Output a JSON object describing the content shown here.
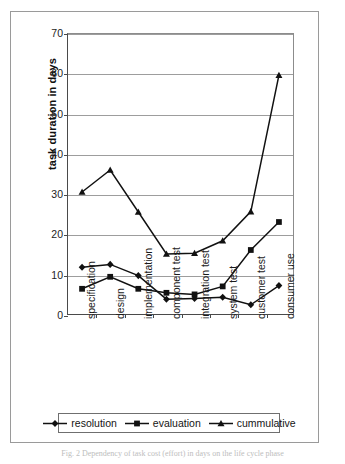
{
  "figure": {
    "caption": "Fig. 2 Dependency of task cost (effort) in days on the life cycle phase"
  },
  "chart_data": {
    "type": "line",
    "title": "",
    "xlabel": "",
    "ylabel": "task duration in days",
    "ylim": [
      0,
      70
    ],
    "ytick_step": 10,
    "yticks": [
      0,
      10,
      20,
      30,
      40,
      50,
      60,
      70
    ],
    "grid": true,
    "legend_position": "bottom",
    "categories": [
      "specification",
      "design",
      "implementation",
      "component test",
      "integration test",
      "system test",
      "customer test",
      "consumer use"
    ],
    "series": [
      {
        "name": "resolution",
        "marker": "diamond",
        "color": "#111111",
        "values": [
          11.7,
          12.4,
          9.6,
          3.7,
          3.9,
          4.2,
          2.3,
          7.1
        ]
      },
      {
        "name": "evaluation",
        "marker": "square",
        "color": "#111111",
        "values": [
          6.3,
          9.3,
          6.3,
          5.3,
          4.9,
          6.9,
          16.0,
          23.0
        ]
      },
      {
        "name": "cummulative",
        "marker": "triangle",
        "color": "#111111",
        "values": [
          30.5,
          36.0,
          25.5,
          15.0,
          15.2,
          18.3,
          25.6,
          59.7
        ]
      }
    ]
  }
}
